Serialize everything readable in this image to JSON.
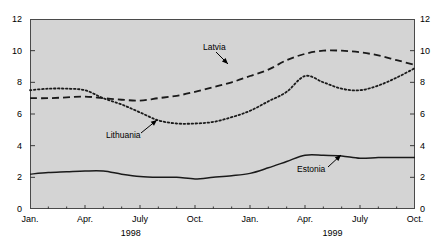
{
  "chart_data": {
    "type": "line",
    "title": "",
    "xlabel": "",
    "ylabel": "",
    "ylim": [
      0,
      12
    ],
    "yticks": [
      0,
      2,
      4,
      6,
      8,
      10,
      12
    ],
    "grid": false,
    "legend": "inline-annotations",
    "x": [
      "Jan. 1998",
      "Feb. 1998",
      "Mar. 1998",
      "Apr. 1998",
      "May 1998",
      "June 1998",
      "July 1998",
      "Aug. 1998",
      "Sep. 1998",
      "Oct. 1998",
      "Nov. 1998",
      "Dec. 1998",
      "Jan. 1999",
      "Feb. 1999",
      "Mar. 1999",
      "Apr. 1999",
      "May 1999",
      "June 1999",
      "July 1999",
      "Aug. 1999",
      "Sep. 1999",
      "Oct. 1999"
    ],
    "xtick_labels": [
      "Jan.",
      "Apr.",
      "July",
      "Oct.",
      "Jan.",
      "Apr.",
      "July",
      "Oct."
    ],
    "xtick_indices": [
      0,
      3,
      6,
      9,
      12,
      15,
      18,
      21
    ],
    "year_labels": [
      "1998",
      "1999"
    ],
    "series": [
      {
        "name": "Latvia",
        "style": "dashed",
        "color": "#1a1a1a",
        "values": [
          7.0,
          7.0,
          7.05,
          7.1,
          7.0,
          6.9,
          6.85,
          7.0,
          7.15,
          7.4,
          7.7,
          8.0,
          8.4,
          8.8,
          9.4,
          9.8,
          10.0,
          10.0,
          9.9,
          9.7,
          9.4,
          9.1
        ]
      },
      {
        "name": "Lithuania",
        "style": "dotted",
        "color": "#1a1a1a",
        "values": [
          7.5,
          7.6,
          7.6,
          7.5,
          7.0,
          6.6,
          6.1,
          5.6,
          5.4,
          5.4,
          5.5,
          5.8,
          6.2,
          6.8,
          7.4,
          8.4,
          8.0,
          7.6,
          7.5,
          7.8,
          8.3,
          8.9
        ]
      },
      {
        "name": "Estonia",
        "style": "solid",
        "color": "#1a1a1a",
        "values": [
          2.2,
          2.3,
          2.35,
          2.4,
          2.4,
          2.2,
          2.05,
          2.0,
          2.0,
          1.9,
          2.0,
          2.1,
          2.25,
          2.6,
          3.0,
          3.4,
          3.4,
          3.35,
          3.2,
          3.25,
          3.25,
          3.25
        ]
      }
    ],
    "annotations": [
      {
        "label": "Latvia",
        "label_x": 203,
        "label_y": 42,
        "arrow_from_x": 216,
        "arrow_from_y": 52,
        "arrow_to_x": 228,
        "arrow_to_y": 64
      },
      {
        "label": "Lithuania",
        "label_x": 106,
        "label_y": 130,
        "arrow_from_x": 141,
        "arrow_from_y": 133,
        "arrow_to_x": 157,
        "arrow_to_y": 120
      },
      {
        "label": "Estonia",
        "label_x": 297,
        "label_y": 164,
        "arrow_from_x": 328,
        "arrow_from_y": 167,
        "arrow_to_x": 341,
        "arrow_to_y": 155
      }
    ]
  }
}
